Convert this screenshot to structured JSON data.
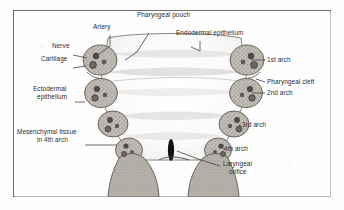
{
  "figure": {
    "frame_color": "#6d6d6d",
    "ink_color": "#2b2b2b",
    "arch_fill": "#b9b4b0",
    "cavity_fill": "#fbfbfb",
    "orifice_color": "#111111"
  },
  "labels": {
    "artery": "Artery",
    "pharyngeal_pouch": "Pharyngeal pouch",
    "endodermal_epithelium": "Endodermal epithelium",
    "nerve": "Nerve",
    "cartilage": "Cartilage",
    "ectodermal_epithelium_l1": "Ectodermal",
    "ectodermal_epithelium_l2": "epithelium",
    "mesenchymal_l1": "Mesenchymal tissue",
    "mesenchymal_l2": "in 4th arch",
    "arch_1": "1st arch",
    "pharyngeal_cleft": "Pharyngeal cleft",
    "arch_2": "2nd arch",
    "arch_3": "3rd arch",
    "arch_4": "4th arch",
    "laryngeal_orifice_l1": "Laryngeal",
    "laryngeal_orifice_l2": "orifice"
  },
  "structures": {
    "arches_per_side": 4,
    "sides": [
      "left",
      "right"
    ],
    "inclusions": [
      "artery",
      "nerve",
      "cartilage"
    ]
  }
}
